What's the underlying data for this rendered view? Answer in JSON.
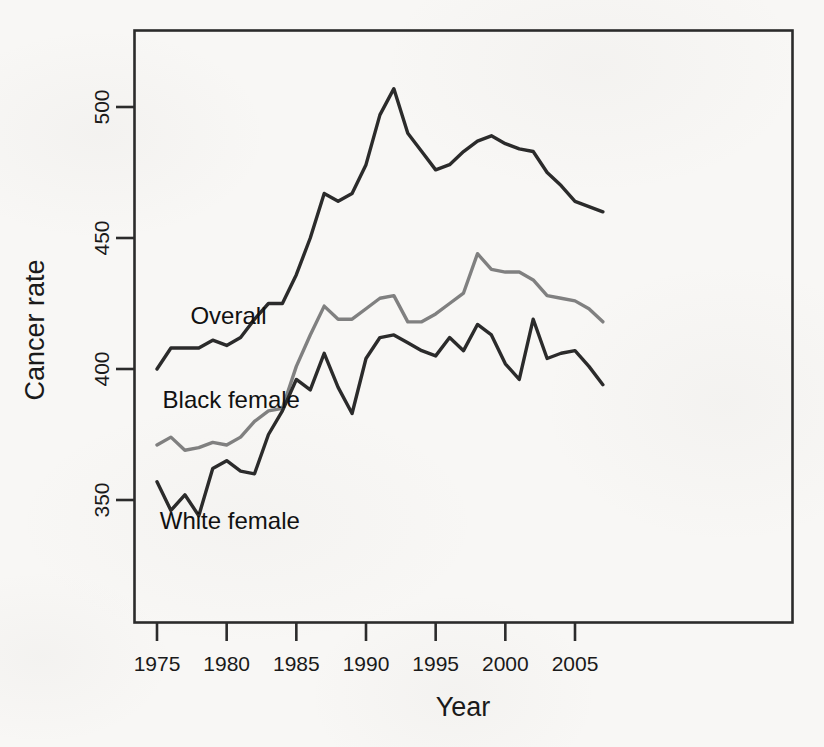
{
  "chart_data": {
    "type": "line",
    "title": "",
    "xlabel": "Year",
    "ylabel": "Cancer rate",
    "xlim": [
      1974,
      2008
    ],
    "ylim": [
      327,
      520
    ],
    "grid": false,
    "legend_position": "inline-labels",
    "xticks": [
      1975,
      1980,
      1985,
      1990,
      1995,
      2000,
      2005
    ],
    "yticks": [
      350,
      400,
      450,
      500
    ],
    "x": [
      1975,
      1976,
      1977,
      1978,
      1979,
      1980,
      1981,
      1982,
      1983,
      1984,
      1985,
      1986,
      1987,
      1988,
      1989,
      1990,
      1991,
      1992,
      1993,
      1994,
      1995,
      1996,
      1997,
      1998,
      1999,
      2000,
      2001,
      2002,
      2003,
      2004,
      2005,
      2006,
      2007
    ],
    "series": [
      {
        "name": "Overall",
        "color": "#2b2b2b",
        "label_x": 1977.4,
        "label_y": 417,
        "values": [
          400,
          408,
          408,
          408,
          411,
          409,
          412,
          419,
          425,
          425,
          436,
          450,
          467,
          464,
          467,
          478,
          497,
          507,
          490,
          483,
          476,
          478,
          483,
          487,
          489,
          486,
          484,
          483,
          475,
          470,
          464,
          462,
          460
        ]
      },
      {
        "name": "Black female",
        "color": "#808080",
        "label_x": 1975.4,
        "label_y": 385,
        "values": [
          371,
          374,
          369,
          370,
          372,
          371,
          374,
          380,
          384,
          385,
          401,
          413,
          424,
          419,
          419,
          423,
          427,
          428,
          418,
          418,
          421,
          425,
          429,
          444,
          438,
          437,
          437,
          434,
          428,
          427,
          426,
          423,
          418
        ]
      },
      {
        "name": "White female",
        "color": "#2b2b2b",
        "label_x": 1975.2,
        "label_y": 339,
        "values": [
          357,
          346,
          352,
          344,
          362,
          365,
          361,
          360,
          375,
          384,
          396,
          392,
          406,
          393,
          383,
          404,
          412,
          413,
          410,
          407,
          405,
          412,
          407,
          417,
          413,
          402,
          396,
          419,
          404,
          406,
          407,
          401,
          394
        ]
      }
    ]
  },
  "axes": {
    "y_label": "Cancer rate",
    "x_label": "Year",
    "x_tick_labels": [
      "1975",
      "1980",
      "1985",
      "1990",
      "1995",
      "2000",
      "2005"
    ],
    "y_tick_labels": [
      "350",
      "400",
      "450",
      "500"
    ]
  },
  "labels": {
    "overall": "Overall",
    "black_female": "Black female",
    "white_female": "White female"
  },
  "colors": {
    "overall": "#2b2b2b",
    "black_female": "#808080",
    "white_female": "#2b2b2b",
    "axis": "#2b2b2b",
    "background": "#f8f7f5"
  }
}
